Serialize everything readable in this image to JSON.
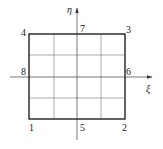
{
  "diagram": {
    "axes": {
      "horizontal_label": "ξ",
      "vertical_label": "η"
    },
    "grid_divisions": 4,
    "nodes": [
      {
        "id": "1",
        "label": "1",
        "position": "bottom-left corner"
      },
      {
        "id": "2",
        "label": "2",
        "position": "bottom-right corner"
      },
      {
        "id": "3",
        "label": "3",
        "position": "top-right corner"
      },
      {
        "id": "4",
        "label": "4",
        "position": "top-left corner"
      },
      {
        "id": "5",
        "label": "5",
        "position": "bottom midside"
      },
      {
        "id": "6",
        "label": "6",
        "position": "right midside"
      },
      {
        "id": "7",
        "label": "7",
        "position": "top midside"
      },
      {
        "id": "8",
        "label": "8",
        "position": "left midside"
      }
    ],
    "colors": {
      "line": "#333333",
      "background": "#ffffff"
    }
  }
}
